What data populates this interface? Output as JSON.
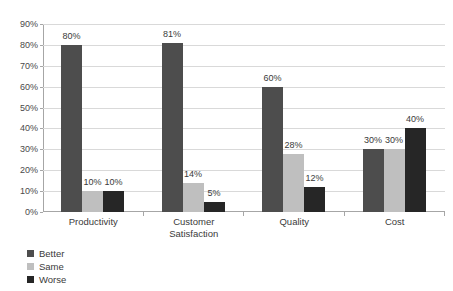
{
  "chart_data": {
    "type": "bar",
    "title": "",
    "subtitle": "",
    "xlabel": "",
    "ylabel": "",
    "categories": [
      "Productivity",
      "Customer Satisfaction",
      "Quality",
      "Cost"
    ],
    "category_lines": [
      [
        "Productivity"
      ],
      [
        "Customer",
        "Satisfaction"
      ],
      [
        "Quality"
      ],
      [
        "Cost"
      ]
    ],
    "series": [
      {
        "name": "Better",
        "color": "#4d4d4d",
        "values": [
          80,
          81,
          60,
          30
        ],
        "labels": [
          "80%",
          "81%",
          "60%",
          "30%"
        ]
      },
      {
        "name": "Same",
        "color": "#bfbfbf",
        "values": [
          10,
          14,
          28,
          30
        ],
        "labels": [
          "10%",
          "14%",
          "28%",
          "30%"
        ]
      },
      {
        "name": "Worse",
        "color": "#262626",
        "values": [
          10,
          5,
          12,
          40
        ],
        "labels": [
          "10%",
          "5%",
          "12%",
          "40%"
        ]
      }
    ],
    "ylim": [
      0,
      90
    ],
    "ytick_values": [
      0,
      10,
      20,
      30,
      40,
      50,
      60,
      70,
      80,
      90
    ],
    "ytick_labels": [
      "0%",
      "10%",
      "20%",
      "30%",
      "40%",
      "50%",
      "60%",
      "70%",
      "80%",
      "90%"
    ],
    "grid": true,
    "grid_color": "#d9d9d9",
    "axis_color": "#a6a6a6",
    "legend_position": "bottom-left",
    "legend_entries": [
      {
        "label": "Better",
        "color": "#4d4d4d"
      },
      {
        "label": "Same",
        "color": "#bfbfbf"
      },
      {
        "label": "Worse",
        "color": "#262626"
      }
    ],
    "background_color": "#ffffff",
    "data_labels_shown": true
  }
}
